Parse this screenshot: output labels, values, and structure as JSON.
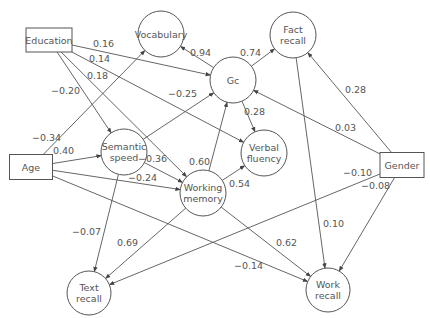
{
  "diagram": {
    "type": "path-diagram",
    "nodes": [
      {
        "id": "education",
        "label": [
          "Education"
        ],
        "shape": "rect",
        "x": 49,
        "y": 40,
        "w": 46,
        "h": 24
      },
      {
        "id": "age",
        "label": [
          "Age"
        ],
        "shape": "rect",
        "x": 31,
        "y": 167,
        "w": 43,
        "h": 25
      },
      {
        "id": "gender",
        "label": [
          "Gender"
        ],
        "shape": "rect",
        "x": 402,
        "y": 165,
        "w": 44,
        "h": 25
      },
      {
        "id": "vocabulary",
        "label": [
          "Vocabulary"
        ],
        "shape": "circle",
        "x": 161,
        "y": 34,
        "r": 23
      },
      {
        "id": "fact_recall",
        "label": [
          "Fact",
          "recall"
        ],
        "shape": "circle",
        "x": 293,
        "y": 35,
        "r": 23
      },
      {
        "id": "gc",
        "label": [
          "Gc"
        ],
        "shape": "circle",
        "x": 233,
        "y": 80,
        "r": 23
      },
      {
        "id": "semantic_speed",
        "label": [
          "Semantic",
          "speed"
        ],
        "shape": "circle",
        "x": 124,
        "y": 152,
        "r": 23
      },
      {
        "id": "verbal_fluency",
        "label": [
          "Verbal",
          "fluency"
        ],
        "shape": "circle",
        "x": 264,
        "y": 153,
        "r": 23
      },
      {
        "id": "working_memory",
        "label": [
          "Working",
          "memory"
        ],
        "shape": "circle",
        "x": 203,
        "y": 193,
        "r": 23
      },
      {
        "id": "text_recall",
        "label": [
          "Text",
          "recall"
        ],
        "shape": "circle",
        "x": 89,
        "y": 293,
        "r": 22
      },
      {
        "id": "work_recall",
        "label": [
          "Work",
          "recall"
        ],
        "shape": "circle",
        "x": 328,
        "y": 290,
        "r": 22
      }
    ],
    "edges": [
      {
        "from": "education",
        "to": "gc",
        "label": "0.16",
        "lx": 93,
        "ly": 47
      },
      {
        "from": "education",
        "to": "verbal_fluency",
        "label": "0.14",
        "lx": 89,
        "ly": 62
      },
      {
        "from": "education",
        "to": "working_memory",
        "label": "0.18",
        "lx": 87,
        "ly": 79
      },
      {
        "from": "education",
        "to": "semantic_speed",
        "label": "−0.20",
        "lx": 51,
        "ly": 94
      },
      {
        "from": "age",
        "to": "vocabulary",
        "label": "−0.34",
        "lx": 32,
        "ly": 141
      },
      {
        "from": "age",
        "to": "semantic_speed",
        "label": "0.40",
        "lx": 53,
        "ly": 154
      },
      {
        "from": "age",
        "to": "working_memory",
        "label": "−0.24",
        "lx": 128,
        "ly": 181
      },
      {
        "from": "age",
        "to": "work_recall",
        "label": "−0.14",
        "lx": 234,
        "ly": 269
      },
      {
        "from": "semantic_speed",
        "to": "gc",
        "label": "−0.25",
        "lx": 168,
        "ly": 97
      },
      {
        "from": "semantic_speed",
        "to": "working_memory",
        "label": "−0.36",
        "lx": 138,
        "ly": 162
      },
      {
        "from": "semantic_speed",
        "to": "text_recall",
        "label": "−0.07",
        "lx": 72,
        "ly": 235
      },
      {
        "from": "gc",
        "to": "vocabulary",
        "label": "0.94",
        "lx": 190,
        "ly": 56
      },
      {
        "from": "gc",
        "to": "fact_recall",
        "label": "0.74",
        "lx": 240,
        "ly": 56
      },
      {
        "from": "gc",
        "to": "verbal_fluency",
        "label": "0.28",
        "lx": 244,
        "ly": 115
      },
      {
        "from": "working_memory",
        "to": "gc",
        "label": "0.60",
        "lx": 189,
        "ly": 165
      },
      {
        "from": "working_memory",
        "to": "verbal_fluency",
        "label": "0.54",
        "lx": 229,
        "ly": 187
      },
      {
        "from": "working_memory",
        "to": "text_recall",
        "label": "0.69",
        "lx": 117,
        "ly": 246
      },
      {
        "from": "working_memory",
        "to": "work_recall",
        "label": "0.62",
        "lx": 276,
        "ly": 246
      },
      {
        "from": "fact_recall",
        "to": "work_recall",
        "label": "0.10",
        "lx": 323,
        "ly": 227
      },
      {
        "from": "gender",
        "to": "fact_recall",
        "label": "0.28",
        "lx": 345,
        "ly": 93
      },
      {
        "from": "gender",
        "to": "gc",
        "label": "0.03",
        "lx": 335,
        "ly": 131
      },
      {
        "from": "gender",
        "to": "text_recall",
        "label": "−0.10",
        "lx": 343,
        "ly": 176
      },
      {
        "from": "gender",
        "to": "work_recall",
        "label": "−0.08",
        "lx": 361,
        "ly": 189
      }
    ]
  }
}
